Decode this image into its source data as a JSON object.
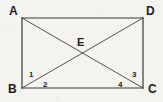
{
  "figure": {
    "type": "geometry-diagram",
    "background_color": "#f4f3f0",
    "line_color": "#3a3a3a",
    "label_color": "#1e1e1e",
    "vertices": [
      {
        "id": "A",
        "label": "A",
        "x": 22,
        "y": 18,
        "label_x": 9,
        "label_y": 5
      },
      {
        "id": "D",
        "label": "D",
        "x": 143,
        "y": 18,
        "label_x": 146,
        "label_y": 5
      },
      {
        "id": "B",
        "label": "B",
        "x": 22,
        "y": 88,
        "label_x": 8,
        "label_y": 83
      },
      {
        "id": "C",
        "label": "C",
        "x": 143,
        "y": 88,
        "label_x": 148,
        "label_y": 83
      }
    ],
    "intersection": {
      "id": "E",
      "label": "E",
      "x": 82.5,
      "y": 53,
      "label_x": 77,
      "label_y": 37
    },
    "sides": [
      {
        "name": "AD",
        "from": "A",
        "to": "D"
      },
      {
        "name": "DC",
        "from": "D",
        "to": "C"
      },
      {
        "name": "CB",
        "from": "C",
        "to": "B"
      },
      {
        "name": "BA",
        "from": "B",
        "to": "A"
      }
    ],
    "diagonals": [
      {
        "name": "AC",
        "from": "A",
        "to": "C"
      },
      {
        "name": "BD",
        "from": "B",
        "to": "D"
      }
    ],
    "angle_labels": [
      {
        "id": "1",
        "label": "1",
        "at_vertex": "B",
        "between": "BA and BD",
        "x": 29,
        "y": 71
      },
      {
        "id": "2",
        "label": "2",
        "at_vertex": "B",
        "between": "BD and BC",
        "x": 43,
        "y": 81
      },
      {
        "id": "3",
        "label": "3",
        "at_vertex": "C",
        "between": "CA and CD",
        "x": 132,
        "y": 71
      },
      {
        "id": "4",
        "label": "4",
        "at_vertex": "C",
        "between": "CB and CA",
        "x": 118,
        "y": 81
      }
    ]
  }
}
